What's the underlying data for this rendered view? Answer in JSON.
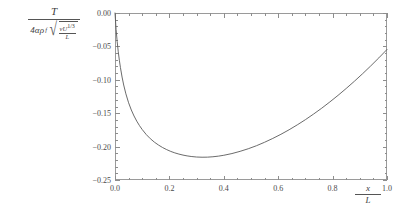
{
  "chart_data": {
    "type": "line",
    "title": "",
    "ylabel_parts": {
      "numerator": "T",
      "denominator_coefficient": "4αρ",
      "denominator_coefficient_sub": "f",
      "radicand_numerator_nu": "ν",
      "radicand_numerator_U": "U",
      "radicand_numerator_exp": "1/3",
      "radicand_denominator": "L"
    },
    "xlabel_parts": {
      "numerator": "x",
      "denominator": "L"
    },
    "xlim": [
      0.0,
      1.0
    ],
    "ylim": [
      -0.25,
      0.0
    ],
    "grid": false,
    "legend": null,
    "x_ticks": [
      {
        "value": 0.0,
        "label": "0.0"
      },
      {
        "value": 0.2,
        "label": "0.2"
      },
      {
        "value": 0.4,
        "label": "0.4"
      },
      {
        "value": 0.6,
        "label": "0.6"
      },
      {
        "value": 0.8,
        "label": "0.8"
      },
      {
        "value": 1.0,
        "label": "1.0"
      }
    ],
    "y_ticks": [
      {
        "value": 0.0,
        "label": "0.00"
      },
      {
        "value": -0.05,
        "label": "-0.05"
      },
      {
        "value": -0.1,
        "label": "-0.10"
      },
      {
        "value": -0.15,
        "label": "-0.15"
      },
      {
        "value": -0.2,
        "label": "-0.20"
      },
      {
        "value": -0.25,
        "label": "-0.25"
      }
    ],
    "x_minor_ticks": [
      0.05,
      0.1,
      0.15,
      0.25,
      0.3,
      0.35,
      0.45,
      0.5,
      0.55,
      0.65,
      0.7,
      0.75,
      0.85,
      0.9,
      0.95
    ],
    "y_minor_ticks": [
      -0.01,
      -0.02,
      -0.03,
      -0.04,
      -0.06,
      -0.07,
      -0.08,
      -0.09,
      -0.11,
      -0.12,
      -0.13,
      -0.14,
      -0.16,
      -0.17,
      -0.18,
      -0.19,
      -0.21,
      -0.22,
      -0.23,
      -0.24
    ],
    "curve_color": "#5a5a5a",
    "frame_color": "#9a9a9a",
    "minimum": {
      "x": 0.25,
      "y": -0.249
    },
    "series": [
      {
        "name": "torque",
        "x": [
          0.0,
          0.004,
          0.008,
          0.012,
          0.016,
          0.02,
          0.026,
          0.032,
          0.04,
          0.05,
          0.06,
          0.07,
          0.08,
          0.09,
          0.1,
          0.115,
          0.13,
          0.145,
          0.16,
          0.175,
          0.19,
          0.205,
          0.22,
          0.235,
          0.25,
          0.265,
          0.28,
          0.3,
          0.32,
          0.34,
          0.36,
          0.38,
          0.4,
          0.43,
          0.46,
          0.49,
          0.52,
          0.55,
          0.58,
          0.61,
          0.64,
          0.67,
          0.7,
          0.73,
          0.76,
          0.79,
          0.82,
          0.85,
          0.88,
          0.91,
          0.94,
          0.97,
          1.0
        ],
        "y": [
          0.0,
          -0.0245,
          -0.043,
          -0.058,
          -0.0707,
          -0.0818,
          -0.0959,
          -0.1078,
          -0.121,
          -0.1344,
          -0.1452,
          -0.1542,
          -0.1619,
          -0.1686,
          -0.1744,
          -0.182,
          -0.1882,
          -0.1934,
          -0.1977,
          -0.2014,
          -0.2045,
          -0.2072,
          -0.2094,
          -0.2112,
          -0.2127,
          -0.2139,
          -0.2148,
          -0.2156,
          -0.2159,
          -0.2158,
          -0.2152,
          -0.2143,
          -0.213,
          -0.2104,
          -0.2071,
          -0.2032,
          -0.1987,
          -0.1935,
          -0.1878,
          -0.1816,
          -0.1748,
          -0.1675,
          -0.1597,
          -0.1513,
          -0.1425,
          -0.1331,
          -0.1233,
          -0.113,
          -0.1022,
          -0.091,
          -0.0793,
          -0.0672,
          -0.0546
        ]
      }
    ]
  }
}
